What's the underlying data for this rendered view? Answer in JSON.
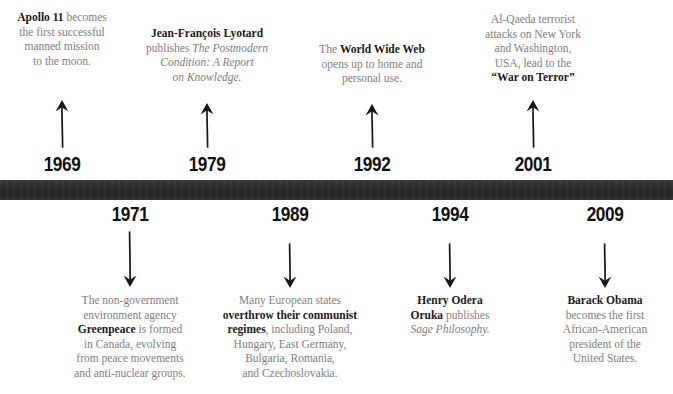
{
  "timeline": {
    "bar_color": "#2b2b2b",
    "body_text_color": "#7d7d7d",
    "emphasis_text_color": "#1a1a1a",
    "events": [
      {
        "year": "1969",
        "side": "above",
        "arrow": "up-arrow-icon",
        "text_plain": "Apollo 11 becomes the first successful manned mission to the moon.",
        "lines": [
          [
            {
              "t": "Apollo 11",
              "s": "bold"
            },
            {
              "t": " becomes",
              "s": "normal"
            }
          ],
          [
            {
              "t": "the first successful",
              "s": "normal"
            }
          ],
          [
            {
              "t": "manned mission",
              "s": "normal"
            }
          ],
          [
            {
              "t": "to the moon.",
              "s": "normal"
            }
          ]
        ]
      },
      {
        "year": "1971",
        "side": "below",
        "arrow": "down-arrow-icon",
        "text_plain": "The non-government environment agency Greenpeace is formed in Canada, evolving from peace movements and anti-nuclear groups.",
        "lines": [
          [
            {
              "t": "The non-government",
              "s": "normal"
            }
          ],
          [
            {
              "t": "environment agency",
              "s": "normal"
            }
          ],
          [
            {
              "t": "Greenpeace",
              "s": "bold"
            },
            {
              "t": " is formed",
              "s": "normal"
            }
          ],
          [
            {
              "t": "in Canada, evolving",
              "s": "normal"
            }
          ],
          [
            {
              "t": "from peace movements",
              "s": "normal"
            }
          ],
          [
            {
              "t": "and anti-nuclear groups.",
              "s": "normal"
            }
          ]
        ]
      },
      {
        "year": "1979",
        "side": "above",
        "arrow": "up-arrow-icon",
        "text_plain": "Jean-François Lyotard publishes The Postmodern Condition: A Report on Knowledge.",
        "lines": [
          [
            {
              "t": "Jean-François Lyotard",
              "s": "bold"
            }
          ],
          [
            {
              "t": "publishes ",
              "s": "normal"
            },
            {
              "t": "The Postmodern",
              "s": "italic"
            }
          ],
          [
            {
              "t": "Condition: A Report",
              "s": "italic"
            }
          ],
          [
            {
              "t": "on Knowledge.",
              "s": "italic"
            }
          ]
        ]
      },
      {
        "year": "1989",
        "side": "below",
        "arrow": "down-arrow-icon",
        "text_plain": "Many European states overthrow their communist regimes, including Poland, Hungary, East Germany, Bulgaria, Romania, and Czechoslovakia.",
        "lines": [
          [
            {
              "t": "Many European states",
              "s": "normal"
            }
          ],
          [
            {
              "t": "overthrow their communist",
              "s": "bold"
            }
          ],
          [
            {
              "t": "regimes",
              "s": "bold"
            },
            {
              "t": ", including Poland,",
              "s": "normal"
            }
          ],
          [
            {
              "t": "Hungary, East Germany,",
              "s": "normal"
            }
          ],
          [
            {
              "t": "Bulgaria, Romania,",
              "s": "normal"
            }
          ],
          [
            {
              "t": "and Czechoslovakia.",
              "s": "normal"
            }
          ]
        ]
      },
      {
        "year": "1992",
        "side": "above",
        "arrow": "up-arrow-icon",
        "text_plain": "The World Wide Web opens up to home and personal use.",
        "lines": [
          [
            {
              "t": "The ",
              "s": "normal"
            },
            {
              "t": "World Wide Web",
              "s": "bold"
            }
          ],
          [
            {
              "t": "opens up to home and",
              "s": "normal"
            }
          ],
          [
            {
              "t": "personal use.",
              "s": "normal"
            }
          ]
        ]
      },
      {
        "year": "1994",
        "side": "below",
        "arrow": "down-arrow-icon",
        "text_plain": "Henry Odera Oruka publishes Sage Philosophy.",
        "lines": [
          [
            {
              "t": "Henry Odera",
              "s": "bold"
            }
          ],
          [
            {
              "t": "Oruka",
              "s": "bold"
            },
            {
              "t": " publishes",
              "s": "normal"
            }
          ],
          [
            {
              "t": "Sage Philosophy.",
              "s": "italic"
            }
          ]
        ]
      },
      {
        "year": "2001",
        "side": "above",
        "arrow": "up-arrow-icon",
        "text_plain": "Al-Qaeda terrorist attacks on New York and Washington, USA, lead to the \"War on Terror\".",
        "lines": [
          [
            {
              "t": "Al-Qaeda terrorist",
              "s": "normal"
            }
          ],
          [
            {
              "t": "attacks on New York",
              "s": "normal"
            }
          ],
          [
            {
              "t": "and Washington,",
              "s": "normal"
            }
          ],
          [
            {
              "t": "USA, lead to the",
              "s": "normal"
            }
          ],
          [
            {
              "t": "“War on Terror”",
              "s": "bold"
            }
          ]
        ]
      },
      {
        "year": "2009",
        "side": "below",
        "arrow": "down-arrow-icon",
        "text_plain": "Barack Obama becomes the first African-American president of the United States.",
        "lines": [
          [
            {
              "t": "Barack Obama",
              "s": "bold"
            }
          ],
          [
            {
              "t": "becomes the first",
              "s": "normal"
            }
          ],
          [
            {
              "t": "African-American",
              "s": "normal"
            }
          ],
          [
            {
              "t": "president of the",
              "s": "normal"
            }
          ],
          [
            {
              "t": "United States.",
              "s": "normal"
            }
          ]
        ]
      }
    ]
  }
}
